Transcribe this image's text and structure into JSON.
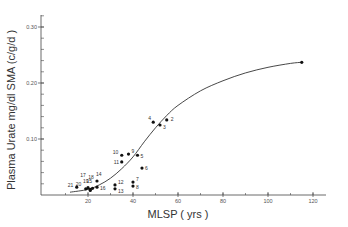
{
  "chart_data": {
    "type": "scatter",
    "title": "",
    "xlabel": "MLSP ( yrs )",
    "ylabel": "Plasma Urate  mg/dl SMA (c/g/d )",
    "xlim": [
      0,
      125
    ],
    "ylim": [
      0,
      0.33
    ],
    "x_ticks": [
      20,
      40,
      60,
      80,
      100,
      120
    ],
    "x_tick_labels": [
      "20",
      "40",
      "60",
      "80",
      "100",
      "120"
    ],
    "x_minor_step": 10,
    "y_ticks": [
      0.1,
      0.2,
      0.3
    ],
    "y_tick_labels": [
      "0.10",
      "0.20",
      "0.30"
    ],
    "y_minor_step": 0.02,
    "grid": false,
    "legend": null,
    "points": [
      {
        "label": "1",
        "x": 115,
        "y": 0.237,
        "show_label": false
      },
      {
        "label": "2",
        "x": 55,
        "y": 0.134
      },
      {
        "label": "3",
        "x": 52,
        "y": 0.125
      },
      {
        "label": "4",
        "x": 49,
        "y": 0.13
      },
      {
        "label": "5",
        "x": 42,
        "y": 0.071
      },
      {
        "label": "6",
        "x": 44,
        "y": 0.048
      },
      {
        "label": "7",
        "x": 40,
        "y": 0.023
      },
      {
        "label": "8",
        "x": 40,
        "y": 0.016
      },
      {
        "label": "9",
        "x": 38,
        "y": 0.073
      },
      {
        "label": "10",
        "x": 35,
        "y": 0.071
      },
      {
        "label": "11",
        "x": 35,
        "y": 0.059
      },
      {
        "label": "12",
        "x": 32,
        "y": 0.018
      },
      {
        "label": "13",
        "x": 32,
        "y": 0.011
      },
      {
        "label": "14",
        "x": 24,
        "y": 0.025
      },
      {
        "label": "15",
        "x": 22,
        "y": 0.012
      },
      {
        "label": "16",
        "x": 24,
        "y": 0.014
      },
      {
        "label": "17",
        "x": 21,
        "y": 0.01
      },
      {
        "label": "18",
        "x": 21,
        "y": 0.008
      },
      {
        "label": "19",
        "x": 20,
        "y": 0.013
      },
      {
        "label": "20",
        "x": 19,
        "y": 0.011
      },
      {
        "label": "21",
        "x": 15,
        "y": 0.014
      }
    ],
    "fit_curve": {
      "type": "sigmoid",
      "x": [
        12,
        20,
        25,
        30,
        35,
        40,
        45,
        50,
        55,
        60,
        70,
        80,
        90,
        100,
        110,
        115
      ],
      "y": [
        0.005,
        0.01,
        0.018,
        0.03,
        0.047,
        0.068,
        0.095,
        0.12,
        0.142,
        0.16,
        0.186,
        0.204,
        0.218,
        0.228,
        0.235,
        0.237
      ]
    }
  },
  "axes": {
    "x_title": "MLSP ( yrs )",
    "y_title": "Plasma Urate  mg/dl SMA (c/g/d )"
  },
  "colors": {
    "axis": "#444444",
    "points": "#111111",
    "curve": "#333333",
    "background": "#ffffff"
  }
}
